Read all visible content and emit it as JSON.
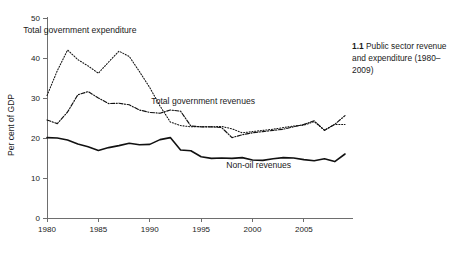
{
  "caption": {
    "number": "1.1",
    "text": "Public sector revenue and expenditure (1980–2009)"
  },
  "chart_data": {
    "type": "line",
    "title": "",
    "xlabel": "",
    "ylabel": "Per cent of GDP",
    "xlim": [
      1980,
      2009
    ],
    "ylim": [
      0,
      50
    ],
    "grid": false,
    "legend_position": "inline-annotations",
    "xticks": [
      "1980",
      "1985",
      "1990",
      "1995",
      "2000",
      "2005"
    ],
    "xtick_values": [
      1980,
      1985,
      1990,
      1995,
      2000,
      2005
    ],
    "yticks": [
      "0",
      "10",
      "20",
      "30",
      "40",
      "50"
    ],
    "ytick_values": [
      0,
      10,
      20,
      30,
      40,
      50
    ],
    "x": [
      1980,
      1981,
      1982,
      1983,
      1984,
      1985,
      1986,
      1987,
      1988,
      1989,
      1990,
      1991,
      1992,
      1993,
      1994,
      1995,
      1996,
      1997,
      1998,
      1999,
      2000,
      2001,
      2002,
      2003,
      2004,
      2005,
      2006,
      2007,
      2008,
      2009
    ],
    "series": [
      {
        "name": "Total government expenditure",
        "style": "dotted",
        "label_x": 1983.2,
        "label_y": 46.2,
        "values": [
          30.6,
          36.8,
          42.0,
          39.6,
          38.0,
          36.2,
          39.0,
          41.7,
          40.4,
          36.6,
          32.6,
          28.0,
          24.0,
          23.1,
          22.8,
          22.8,
          22.8,
          22.9,
          22.3,
          21.3,
          21.6,
          21.9,
          22.2,
          22.6,
          23.0,
          23.2,
          24.1,
          22.0,
          23.4,
          23.4
        ]
      },
      {
        "name": "Total government revenues",
        "style": "dash-dot",
        "label_x": 1995.2,
        "label_y": 28.4,
        "values": [
          24.5,
          23.6,
          26.5,
          30.8,
          31.6,
          30.0,
          28.6,
          28.7,
          28.3,
          27.0,
          26.4,
          26.2,
          27.0,
          26.7,
          23.0,
          22.8,
          22.8,
          22.6,
          20.1,
          20.8,
          21.3,
          21.6,
          21.9,
          22.2,
          22.8,
          23.4,
          24.3,
          21.9,
          23.4,
          25.6
        ]
      },
      {
        "name": "Non-oil revenues",
        "style": "solid",
        "label_x": 2000.6,
        "label_y": 12.6,
        "values": [
          20.1,
          20.0,
          19.5,
          18.5,
          17.8,
          16.9,
          17.6,
          18.1,
          18.7,
          18.3,
          18.4,
          19.6,
          20.1,
          17.0,
          16.8,
          15.3,
          14.9,
          15.0,
          14.9,
          15.1,
          14.5,
          14.4,
          14.8,
          15.1,
          15.0,
          14.6,
          14.3,
          14.8,
          14.1,
          16.0
        ]
      }
    ]
  }
}
